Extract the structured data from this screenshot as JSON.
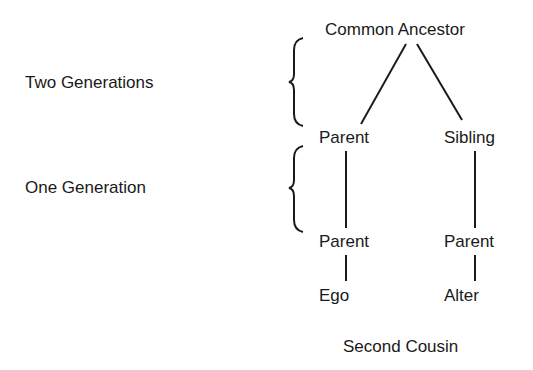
{
  "diagram": {
    "type": "kinship",
    "caption": "Second Cousin",
    "generation_labels": [
      {
        "label": "Two Generations"
      },
      {
        "label": "One Generation"
      }
    ],
    "nodes": {
      "common_ancestor": "Common Ancestor",
      "left_parent_upper": "Parent",
      "sibling": "Sibling",
      "left_parent_lower": "Parent",
      "right_parent_lower": "Parent",
      "ego": "Ego",
      "alter": "Alter"
    },
    "edges": [
      [
        "Common Ancestor",
        "Parent (upper left)"
      ],
      [
        "Common Ancestor",
        "Sibling"
      ],
      [
        "Parent (upper left)",
        "Parent (lower left)"
      ],
      [
        "Sibling",
        "Parent (lower right)"
      ],
      [
        "Parent (lower left)",
        "Ego"
      ],
      [
        "Parent (lower right)",
        "Alter"
      ]
    ]
  }
}
